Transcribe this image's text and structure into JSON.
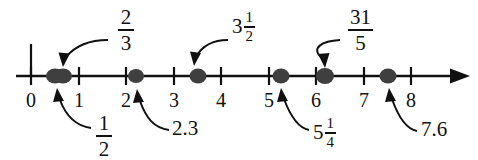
{
  "figure": {
    "type": "number-line",
    "axis": {
      "min_label": 0,
      "max_label": 8,
      "tick_labels": [
        "0",
        "1",
        "2",
        "3",
        "4",
        "5",
        "6",
        "7",
        "8"
      ],
      "arrow_direction": "right",
      "line_color": "#101010",
      "point_color": "#3f3f3f"
    },
    "points": [
      {
        "id": "p-half",
        "value": 0.5,
        "label_text": "1/2",
        "label_kind": "fraction",
        "numerator": "1",
        "denominator": "2",
        "label_side": "below"
      },
      {
        "id": "p-two-thirds",
        "value": 0.667,
        "label_text": "2/3",
        "label_kind": "fraction",
        "numerator": "2",
        "denominator": "3",
        "label_side": "above"
      },
      {
        "id": "p-two-point-three",
        "value": 2.3,
        "label_text": "2.3",
        "label_kind": "decimal",
        "label_side": "below"
      },
      {
        "id": "p-three-and-half",
        "value": 3.5,
        "label_text": "3 1/2",
        "label_kind": "mixed",
        "whole": "3",
        "numerator": "1",
        "denominator": "2",
        "label_side": "above"
      },
      {
        "id": "p-five-and-quarter",
        "value": 5.25,
        "label_text": "5 1/4",
        "label_kind": "mixed",
        "whole": "5",
        "numerator": "1",
        "denominator": "4",
        "label_side": "below"
      },
      {
        "id": "p-thirty-one-fifths",
        "value": 6.2,
        "label_text": "31/5",
        "label_kind": "fraction",
        "numerator": "31",
        "denominator": "5",
        "label_side": "above"
      },
      {
        "id": "p-seven-point-six",
        "value": 7.6,
        "label_text": "7.6",
        "label_kind": "decimal",
        "label_side": "below"
      }
    ]
  },
  "ticks": {
    "t0": "0",
    "t1": "1",
    "t2": "2",
    "t3": "3",
    "t4": "4",
    "t5": "5",
    "t6": "6",
    "t7": "7",
    "t8": "8"
  },
  "labels": {
    "two_thirds_num": "2",
    "two_thirds_den": "3",
    "three_half_whole": "3",
    "three_half_num": "1",
    "three_half_den": "2",
    "thirtyone_fifths_num": "31",
    "thirtyone_fifths_den": "5",
    "one_half_num": "1",
    "one_half_den": "2",
    "two_point_three": "2.3",
    "five_quarter_whole": "5",
    "five_quarter_num": "1",
    "five_quarter_den": "4",
    "seven_point_six": "7.6"
  }
}
